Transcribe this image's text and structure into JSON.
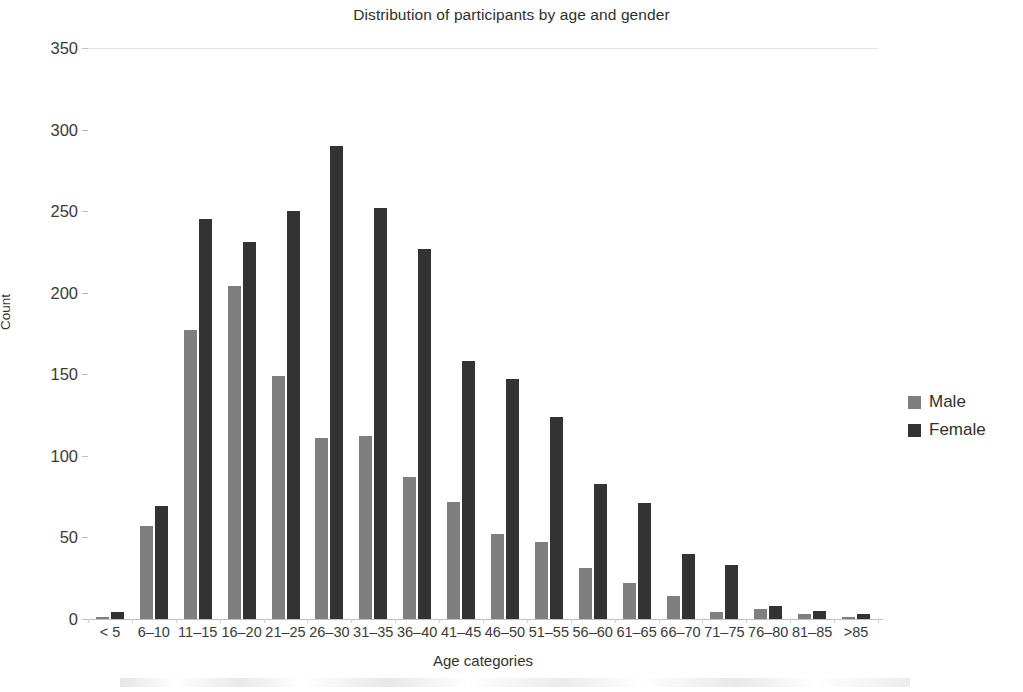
{
  "chart_data": {
    "type": "bar",
    "title": "Distribution of participants by age and gender",
    "xlabel": "Age categories",
    "ylabel": "Count",
    "ylim": [
      0,
      350
    ],
    "yticks": [
      0,
      50,
      100,
      150,
      200,
      250,
      300,
      350
    ],
    "grid": false,
    "legend_position": "right",
    "categories": [
      "< 5",
      "6–10",
      "11–15",
      "16–20",
      "21–25",
      "26–30",
      "31–35",
      "36–40",
      "41–45",
      "46–50",
      "51–55",
      "56–60",
      "61–65",
      "66–70",
      "71–75",
      "76–80",
      "81–85",
      ">85"
    ],
    "series": [
      {
        "name": "Male",
        "color": "#7f7f7f",
        "values": [
          1,
          57,
          177,
          204,
          149,
          111,
          112,
          87,
          72,
          52,
          47,
          31,
          22,
          14,
          4,
          6,
          3,
          1
        ]
      },
      {
        "name": "Female",
        "color": "#333333",
        "values": [
          4,
          69,
          245,
          231,
          250,
          290,
          252,
          227,
          158,
          147,
          124,
          83,
          71,
          40,
          33,
          8,
          5,
          3
        ]
      }
    ]
  },
  "legend": {
    "items": [
      {
        "label": "Male",
        "color": "#7f7f7f"
      },
      {
        "label": "Female",
        "color": "#333333"
      }
    ]
  }
}
